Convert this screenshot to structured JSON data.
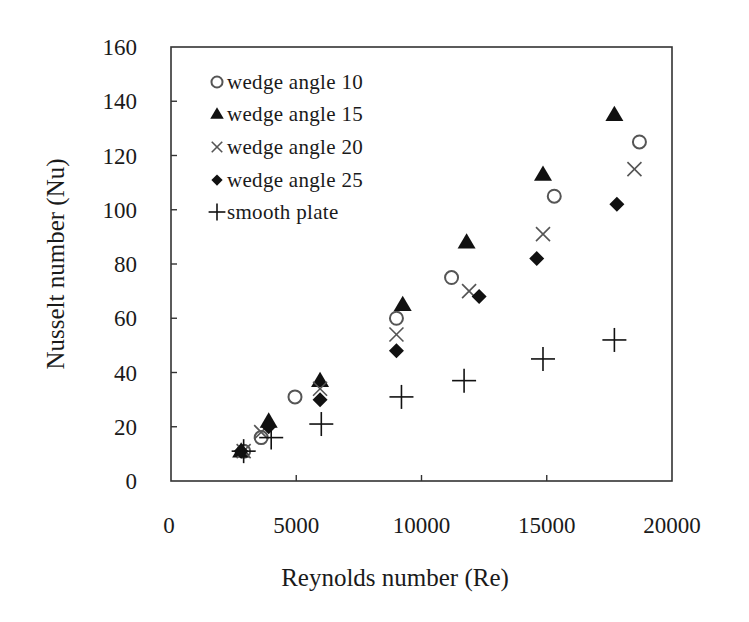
{
  "chart_data": {
    "type": "scatter",
    "title": "",
    "xlabel": "Reynolds number (Re)",
    "ylabel": "Nusselt number (Nu)",
    "xlim": [
      0,
      20000
    ],
    "ylim": [
      0,
      160
    ],
    "xticks": [
      0,
      5000,
      10000,
      15000,
      20000
    ],
    "yticks": [
      0,
      20,
      40,
      60,
      80,
      100,
      120,
      140,
      160
    ],
    "grid": false,
    "legend_position": "upper-left inside",
    "series": [
      {
        "name": "wedge angle 10",
        "marker": "circle-open",
        "x": [
          2900,
          3600,
          4950,
          9000,
          11200,
          15300,
          18700
        ],
        "y": [
          11,
          16,
          31,
          60,
          75,
          105,
          125
        ]
      },
      {
        "name": "wedge angle 15",
        "marker": "triangle-filled",
        "x": [
          2800,
          3900,
          5950,
          9250,
          11800,
          14850,
          17700
        ],
        "y": [
          11,
          22,
          37,
          65,
          88,
          113,
          135
        ]
      },
      {
        "name": "wedge angle 20",
        "marker": "x",
        "x": [
          2900,
          3600,
          5950,
          9000,
          11900,
          14850,
          18500
        ],
        "y": [
          11,
          18,
          34,
          54,
          70,
          91,
          115
        ]
      },
      {
        "name": "wedge angle 25",
        "marker": "diamond-filled",
        "x": [
          2800,
          3900,
          5950,
          9000,
          12300,
          14600,
          17800
        ],
        "y": [
          11,
          20,
          30,
          48,
          68,
          82,
          102
        ]
      },
      {
        "name": "smooth plate",
        "marker": "plus",
        "x": [
          2900,
          4000,
          6000,
          9200,
          11700,
          14850,
          17700
        ],
        "y": [
          11,
          16,
          21,
          31,
          37,
          45,
          52
        ]
      }
    ]
  },
  "legend": {
    "items": [
      {
        "label": "wedge angle 10",
        "marker": "circle-open"
      },
      {
        "label": "wedge angle 15",
        "marker": "triangle-filled"
      },
      {
        "label": "wedge angle 20",
        "marker": "x"
      },
      {
        "label": "wedge angle 25",
        "marker": "diamond-filled"
      },
      {
        "label": "smooth plate",
        "marker": "plus"
      }
    ]
  },
  "colors": {
    "marker_dark": "#111111",
    "marker_light": "#555555",
    "axis": "#333333"
  }
}
